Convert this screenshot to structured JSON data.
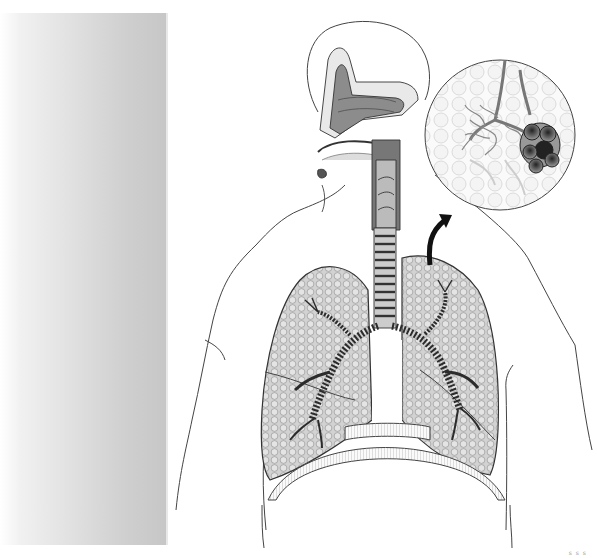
{
  "figure": {
    "parts": [
      "nasal cavity",
      "pharynx",
      "larynx",
      "trachea",
      "bronchi",
      "lungs",
      "diaphragm",
      "alveoli (magnified inset)"
    ],
    "inset": "magnified alveolar sac with capillary network",
    "colors": {
      "background": "#ffffff",
      "line": "#3a3a3a",
      "lung_fill": "#c9c9c9",
      "cartilage": "#555555",
      "side_bar_dark": "#c6c6c6",
      "arrow": "#111111"
    }
  },
  "page_mark": "s s s"
}
